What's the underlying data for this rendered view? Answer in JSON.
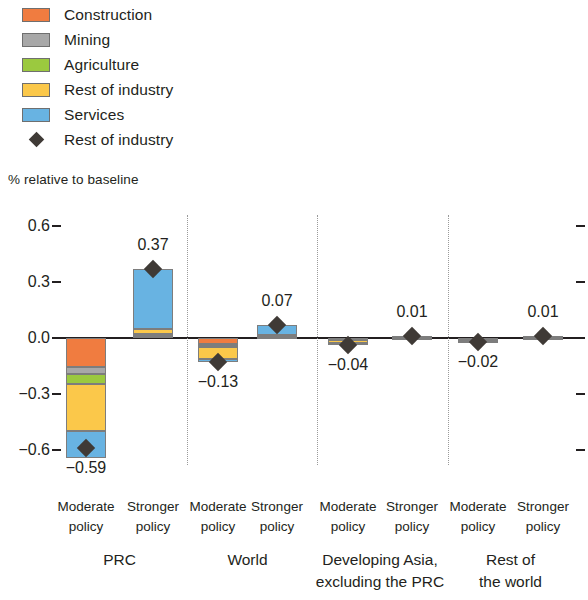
{
  "legend": {
    "items": [
      {
        "label": "Construction",
        "color": "#F07C40",
        "marker": "swatch"
      },
      {
        "label": "Mining",
        "color": "#A8A8A8",
        "marker": "swatch"
      },
      {
        "label": "Agriculture",
        "color": "#9BC93F",
        "marker": "swatch"
      },
      {
        "label": "Rest of industry",
        "color": "#FBC84A",
        "marker": "swatch"
      },
      {
        "label": "Services",
        "color": "#68B3E2",
        "marker": "swatch"
      },
      {
        "label": "Rest of industry",
        "color": "#3F3A36",
        "marker": "diamond"
      }
    ]
  },
  "axis": {
    "title": "% relative to baseline",
    "yticks": [
      "0.6",
      "0.3",
      "0.0",
      "-0.3",
      "-0.6"
    ],
    "ytick_values": [
      0.6,
      0.3,
      0.0,
      -0.3,
      -0.6
    ]
  },
  "chart_data": {
    "type": "bar",
    "title": "",
    "xlabel": "",
    "ylabel": "% relative to baseline",
    "ylim": [
      -0.72,
      0.72
    ],
    "grid": false,
    "stacked": true,
    "legend_position": "top-left",
    "categories": [
      "PRC / Moderate policy",
      "PRC / Stronger policy",
      "World / Moderate policy",
      "World / Stronger policy",
      "Developing Asia, excluding the PRC / Moderate policy",
      "Developing Asia, excluding the PRC / Stronger policy",
      "Rest of the world / Moderate policy",
      "Rest of the world / Stronger policy"
    ],
    "groups": [
      {
        "name": "PRC",
        "bars": [
          {
            "policy": "Moderate policy",
            "total_label": "-0.59",
            "total": -0.59,
            "segments": [
              {
                "name": "Construction",
                "value": -0.155
              },
              {
                "name": "Mining",
                "value": -0.04
              },
              {
                "name": "Agriculture",
                "value": -0.05
              },
              {
                "name": "Rest of industry",
                "value": -0.255
              },
              {
                "name": "Services",
                "value": -0.145
              }
            ]
          },
          {
            "policy": "Stronger policy",
            "total_label": "0.37",
            "total": 0.37,
            "segments": [
              {
                "name": "Construction",
                "value": 0.01
              },
              {
                "name": "Mining",
                "value": 0.005
              },
              {
                "name": "Agriculture",
                "value": 0.005
              },
              {
                "name": "Rest of industry",
                "value": 0.03
              },
              {
                "name": "Services",
                "value": 0.32
              }
            ]
          }
        ]
      },
      {
        "name": "World",
        "bars": [
          {
            "policy": "Moderate policy",
            "total_label": "-0.13",
            "total": -0.13,
            "segments": [
              {
                "name": "Construction",
                "value": -0.03
              },
              {
                "name": "Mining",
                "value": -0.01
              },
              {
                "name": "Agriculture",
                "value": -0.01
              },
              {
                "name": "Rest of industry",
                "value": -0.065
              },
              {
                "name": "Services",
                "value": -0.015
              }
            ]
          },
          {
            "policy": "Stronger policy",
            "total_label": "0.07",
            "total": 0.07,
            "segments": [
              {
                "name": "Construction",
                "value": 0.004
              },
              {
                "name": "Mining",
                "value": 0.002
              },
              {
                "name": "Agriculture",
                "value": 0.002
              },
              {
                "name": "Rest of industry",
                "value": 0.008
              },
              {
                "name": "Services",
                "value": 0.054
              }
            ]
          }
        ]
      },
      {
        "name": "Developing Asia, excluding the PRC",
        "bars": [
          {
            "policy": "Moderate policy",
            "total_label": "-0.04",
            "total": -0.04,
            "segments": [
              {
                "name": "Construction",
                "value": -0.004
              },
              {
                "name": "Mining",
                "value": -0.002
              },
              {
                "name": "Agriculture",
                "value": -0.004
              },
              {
                "name": "Rest of industry",
                "value": -0.018
              },
              {
                "name": "Services",
                "value": -0.012
              }
            ]
          },
          {
            "policy": "Stronger policy",
            "total_label": "0.01",
            "total": 0.01,
            "segments": [
              {
                "name": "Construction",
                "value": 0.001
              },
              {
                "name": "Mining",
                "value": 0.001
              },
              {
                "name": "Agriculture",
                "value": 0.002
              },
              {
                "name": "Rest of industry",
                "value": 0.003
              },
              {
                "name": "Services",
                "value": 0.003
              }
            ]
          }
        ]
      },
      {
        "name": "Rest of the world",
        "bars": [
          {
            "policy": "Moderate policy",
            "total_label": "-0.02",
            "total": -0.02,
            "segments": [
              {
                "name": "Construction",
                "value": -0.002
              },
              {
                "name": "Mining",
                "value": -0.003
              },
              {
                "name": "Agriculture",
                "value": -0.005
              },
              {
                "name": "Rest of industry",
                "value": -0.006
              },
              {
                "name": "Services",
                "value": -0.004
              }
            ]
          },
          {
            "policy": "Stronger policy",
            "total_label": "0.01",
            "total": 0.01,
            "segments": [
              {
                "name": "Construction",
                "value": 0.001
              },
              {
                "name": "Mining",
                "value": 0.001
              },
              {
                "name": "Agriculture",
                "value": 0.002
              },
              {
                "name": "Rest of industry",
                "value": 0.003
              },
              {
                "name": "Services",
                "value": 0.003
              }
            ]
          }
        ]
      }
    ],
    "marker_series": {
      "name": "Rest of industry",
      "color": "#3F3A36",
      "values": [
        -0.59,
        0.37,
        -0.13,
        0.07,
        -0.04,
        0.01,
        -0.02,
        0.01
      ],
      "labels": [
        "-0.59",
        "0.37",
        "-0.13",
        "0.07",
        "-0.04",
        "0.01",
        "-0.02",
        "0.01"
      ]
    }
  },
  "xaxis": {
    "policy_labels": [
      "Moderate\npolicy",
      "Stronger\npolicy",
      "Moderate\npolicy",
      "Stronger\npolicy",
      "Moderate\npolicy",
      "Stronger\npolicy",
      "Moderate\npolicy",
      "Stronger\npolicy"
    ],
    "group_labels": [
      "PRC",
      "World",
      "Developing Asia,\nexcluding the PRC",
      "Rest of\nthe world"
    ]
  },
  "colors": {
    "construction": "#F07C40",
    "mining": "#A8A8A8",
    "agriculture": "#9BC93F",
    "rest_of_industry": "#FBC84A",
    "services": "#68B3E2",
    "marker": "#3F3A36",
    "axis": "#231F20",
    "divider": "#9A9A9A"
  }
}
